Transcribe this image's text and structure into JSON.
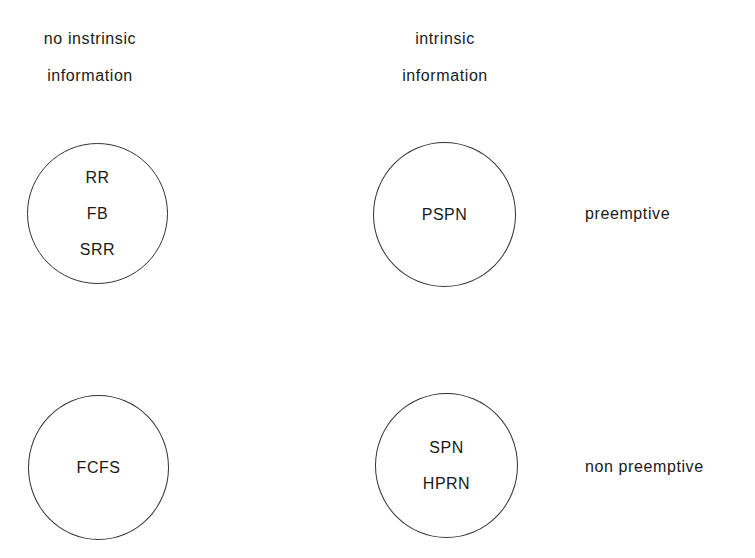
{
  "columns": [
    {
      "line1": "no instrinsic",
      "line2": "information"
    },
    {
      "line1": "intrinsic",
      "line2": "information"
    }
  ],
  "rows": [
    {
      "label": "preemptive"
    },
    {
      "label": "non preemptive"
    }
  ],
  "cells": {
    "no_info_preemptive": [
      "RR",
      "FB",
      "SRR"
    ],
    "info_preemptive": [
      "PSPN"
    ],
    "no_info_nonpreemptive": [
      "FCFS"
    ],
    "info_nonpreemptive": [
      "SPN",
      "HPRN"
    ]
  }
}
